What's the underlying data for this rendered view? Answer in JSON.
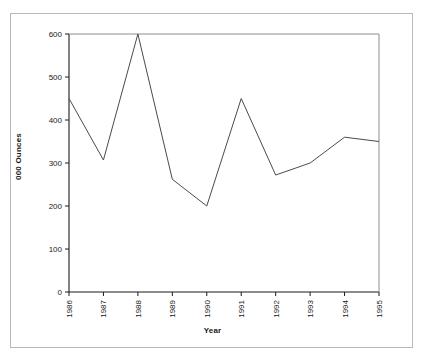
{
  "figure": {
    "clipped_title": "",
    "background_color": "#ffffff",
    "frame_color": "#b9b9bd",
    "line_color": "#4a4a4a",
    "axis_color": "#1a1a1a",
    "tick_label_color": "#1a1a1a"
  },
  "chart_data": {
    "type": "line",
    "title": "",
    "xlabel": "Year",
    "ylabel": "000 Ounces",
    "categories": [
      "1986",
      "1987",
      "1988",
      "1989",
      "1990",
      "1991",
      "1992",
      "1993",
      "1994",
      "1995"
    ],
    "values": [
      450,
      307,
      600,
      262,
      200,
      450,
      272,
      300,
      360,
      350
    ],
    "series": [
      {
        "name": "000 Ounces",
        "values": [
          450,
          307,
          600,
          262,
          200,
          450,
          272,
          300,
          360,
          350
        ]
      }
    ],
    "x": [
      1986,
      1987,
      1988,
      1989,
      1990,
      1991,
      1992,
      1993,
      1994,
      1995
    ],
    "ylim": [
      0,
      600
    ],
    "xlim": [
      1986,
      1995
    ],
    "yticks": [
      0,
      100,
      200,
      300,
      400,
      500,
      600
    ],
    "ytick_labels": [
      "0",
      "100",
      "200",
      "300",
      "400",
      "500",
      "600"
    ],
    "xtick_labels": [
      "1986",
      "1987",
      "1988",
      "1989",
      "1990",
      "1991",
      "1992",
      "1993",
      "1994",
      "1995"
    ],
    "xtick_rotation": 90,
    "grid": false,
    "legend": false,
    "legend_position": "none",
    "markers": false,
    "line_width": 1
  }
}
